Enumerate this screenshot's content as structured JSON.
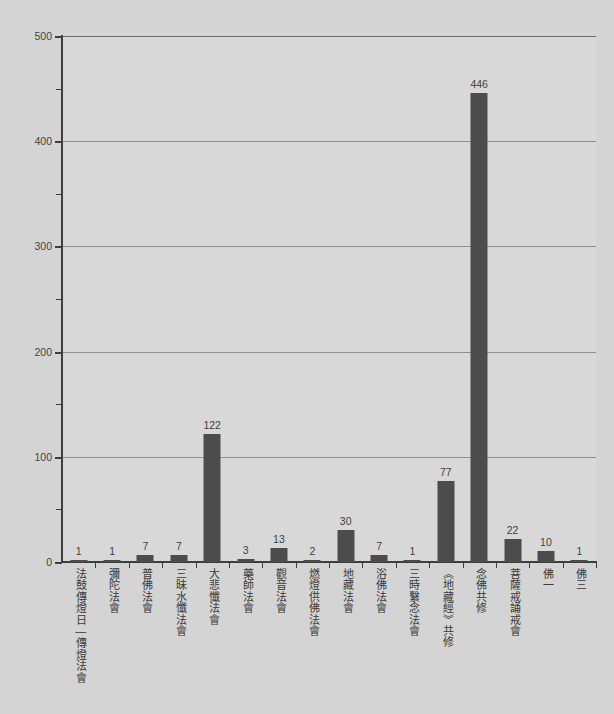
{
  "chart_data": {
    "type": "bar",
    "title": "",
    "subtitle": "",
    "xlabel": "",
    "ylabel": "",
    "ylim": [
      0,
      500
    ],
    "y_ticks_major": [
      0,
      100,
      200,
      300,
      400,
      500
    ],
    "y_ticks_minor": [
      50,
      150,
      250,
      350,
      450
    ],
    "grid": "horizontal",
    "legend": "none",
    "orientation": "vertical",
    "bar_color": "#4c4c4c",
    "background_color": "#d4d4d4",
    "plot_background_color": "#d8d8d8",
    "axis_color": "#3d3d3d",
    "gridline_color": "#8f8f8f",
    "categories": [
      "法鼓傳燈日—傳燈法會",
      "彌陀法會",
      "普佛法會",
      "三昧水懺法會",
      "大悲懺法會",
      "藥師法會",
      "觀音法會",
      "燃燈供佛法會",
      "地藏法會",
      "浴佛法會",
      "三時繫念法會",
      "《地藏經》共修",
      "念佛共修",
      "菩薩戒誦戒會",
      "佛一",
      "佛三"
    ],
    "values": [
      1,
      1,
      7,
      7,
      122,
      3,
      13,
      2,
      30,
      7,
      1,
      77,
      446,
      22,
      10,
      1
    ],
    "value_labels": [
      "1",
      "1",
      "7",
      "7",
      "122",
      "3",
      "13",
      "2",
      "30",
      "7",
      "1",
      "77",
      "446",
      "22",
      "10",
      "1"
    ],
    "y_tick_labels": [
      "0",
      "100",
      "200",
      "300",
      "400",
      "500"
    ]
  }
}
